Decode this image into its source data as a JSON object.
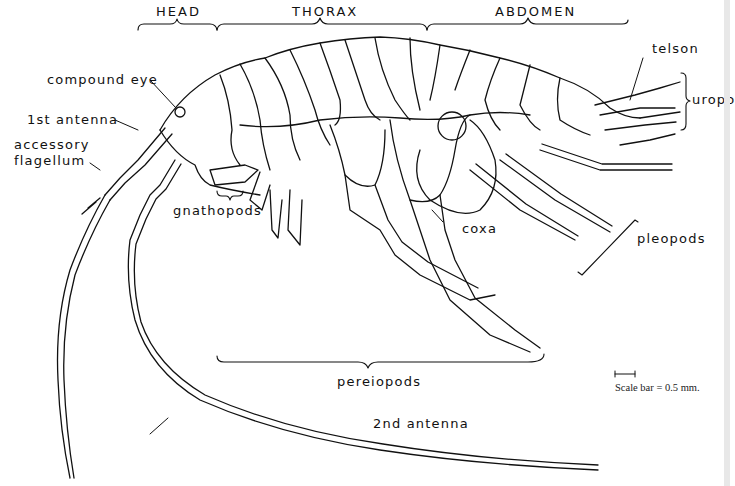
{
  "figure": {
    "body_regions": {
      "head": "HEAD",
      "thorax": "THORAX",
      "abdomen": "ABDOMEN"
    },
    "labels": {
      "compound_eye": "compound eye",
      "first_antenna": "1st antenna",
      "accessory_flagellum_line1": "accessory",
      "accessory_flagellum_line2": "flagellum",
      "gnathopods": "gnathopods",
      "coxa": "coxa",
      "telson": "telson",
      "uropods": "uropo",
      "pleopods": "pleopods",
      "pereiopods": "pereiopods",
      "second_antenna": "2nd antenna"
    },
    "scale": {
      "text": "Scale bar = 0.5 mm."
    },
    "colors": {
      "ink": "#111111",
      "background": "#ffffff"
    }
  }
}
